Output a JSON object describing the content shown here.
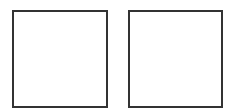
{
  "diagram": {
    "shapes": [
      {
        "type": "square",
        "fill": "#ffffff",
        "stroke": "#333333"
      },
      {
        "type": "square",
        "fill": "#ffffff",
        "stroke": "#333333"
      }
    ]
  }
}
